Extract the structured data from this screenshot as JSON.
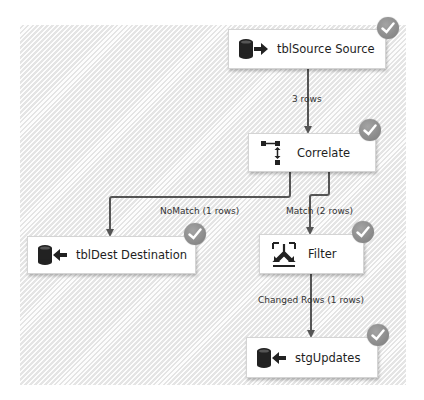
{
  "diagram": {
    "nodes": [
      {
        "id": "source",
        "label": "tblSource Source",
        "icon": "source-database-icon",
        "status": "success"
      },
      {
        "id": "correlate",
        "label": "Correlate",
        "icon": "correlate-icon",
        "status": "success"
      },
      {
        "id": "dest",
        "label": "tblDest Destination",
        "icon": "destination-database-icon",
        "status": "success"
      },
      {
        "id": "filter",
        "label": "Filter",
        "icon": "filter-icon",
        "status": "success"
      },
      {
        "id": "stg",
        "label": "stgUpdates",
        "icon": "destination-database-icon",
        "status": "success"
      }
    ],
    "edges": [
      {
        "from": "source",
        "to": "correlate",
        "label": "3 rows"
      },
      {
        "from": "correlate",
        "to": "dest",
        "label": "NoMatch (1 rows)"
      },
      {
        "from": "correlate",
        "to": "filter",
        "label": "Match (2 rows)"
      },
      {
        "from": "filter",
        "to": "stg",
        "label": "Changed Rows (1 rows)"
      }
    ]
  },
  "colors": {
    "wire": "#555555",
    "badge": "#8a8a8a",
    "canvas": "#efefef"
  }
}
